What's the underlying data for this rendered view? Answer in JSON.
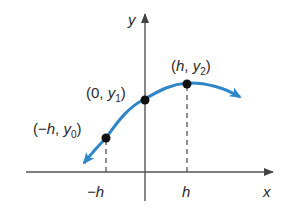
{
  "diagram": {
    "axes": {
      "x_label": "x",
      "y_label": "y",
      "axis_color": "#555555"
    },
    "curve": {
      "color": "#2e86c8",
      "description": "concave-down parabola-like curve with arrows at both ends"
    },
    "points": [
      {
        "label_open": "(−",
        "label_var": "h",
        "label_sep": ", ",
        "label_y": "y",
        "label_sub": "0",
        "label_close": ")",
        "x_tick": "−h"
      },
      {
        "label_open": "(0",
        "label_var": "",
        "label_sep": ", ",
        "label_y": "y",
        "label_sub": "1",
        "label_close": ")"
      },
      {
        "label_open": "(",
        "label_var": "h",
        "label_sep": ", ",
        "label_y": "y",
        "label_sub": "2",
        "label_close": ")",
        "x_tick": "h"
      }
    ],
    "ticks": {
      "neg_h": "−h",
      "h": "h"
    }
  }
}
